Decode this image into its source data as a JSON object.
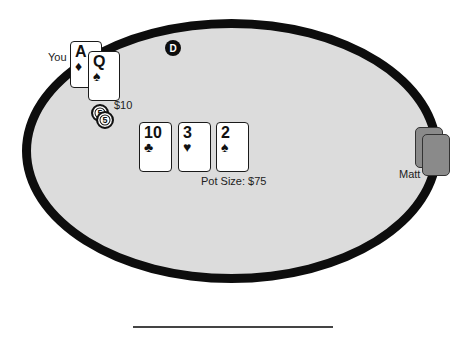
{
  "table": {
    "felt_color": "#dcdcdc",
    "rail_color": "#0d0d0d",
    "dealer_button": "D",
    "pot_label": "Pot Size: $75"
  },
  "players": {
    "you": {
      "name": "You",
      "bet": "$10",
      "chips": [
        "5",
        "5"
      ],
      "cards": [
        {
          "rank": "A",
          "suit": "♦",
          "suit_name": "diamonds"
        },
        {
          "rank": "Q",
          "suit": "♠",
          "suit_name": "spades"
        }
      ]
    },
    "opponent": {
      "name": "Matt",
      "cards": [
        "face-down",
        "face-down"
      ]
    }
  },
  "board": [
    {
      "rank": "10",
      "suit": "♣",
      "suit_name": "clubs"
    },
    {
      "rank": "3",
      "suit": "♥",
      "suit_name": "hearts"
    },
    {
      "rank": "2",
      "suit": "♠",
      "suit_name": "spades"
    }
  ]
}
